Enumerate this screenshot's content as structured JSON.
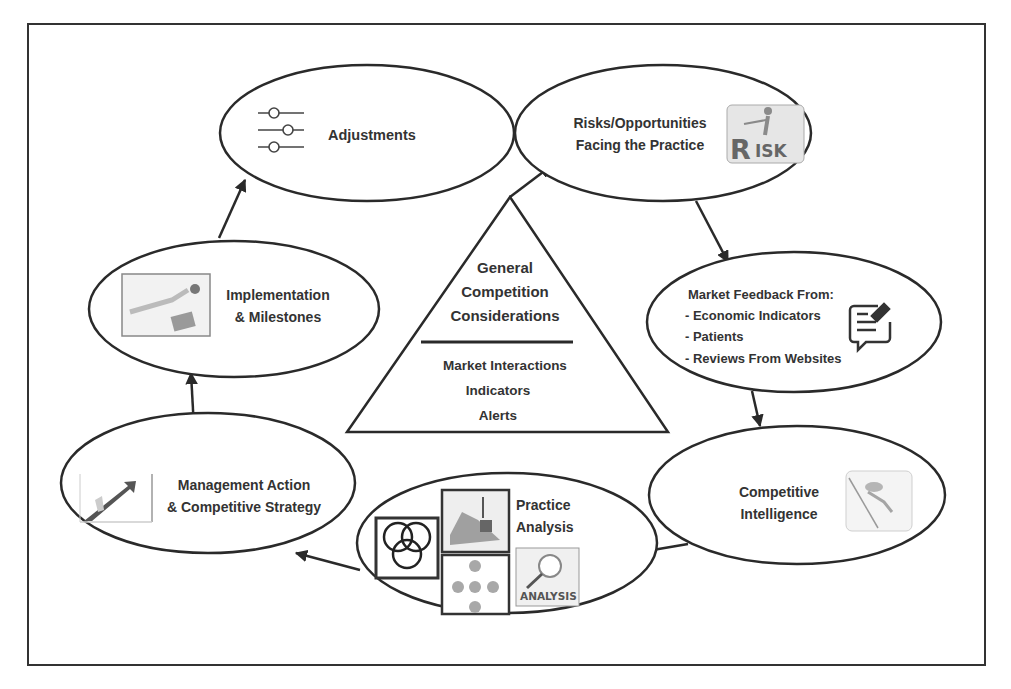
{
  "diagram": {
    "type": "cycle",
    "colors": {
      "stroke": "#2a2a2a",
      "text": "#333333",
      "background": "#ffffff",
      "icon_gray": "#8a8a8a"
    },
    "center": {
      "title_lines": [
        "General",
        "Competition",
        "Considerations"
      ],
      "items": [
        "Market Interactions",
        "Indicators",
        "Alerts"
      ]
    },
    "nodes": [
      {
        "id": "adjustments",
        "lines": [
          "Adjustments"
        ],
        "icon": "sliders-icon"
      },
      {
        "id": "risks",
        "lines": [
          "Risks/Opportunities",
          "Facing the Practice"
        ],
        "icon": "risk-icon",
        "icon_text": "RISK"
      },
      {
        "id": "market-feedback",
        "lines": [
          "Market Feedback From:",
          "- Economic Indicators",
          "- Patients",
          "- Reviews From Websites"
        ],
        "icon": "feedback-chat-icon"
      },
      {
        "id": "competitive-intelligence",
        "lines": [
          "Competitive",
          "Intelligence"
        ],
        "icon": "climber-icon"
      },
      {
        "id": "practice-analysis",
        "lines": [
          "Practice",
          "Analysis"
        ],
        "icons": [
          "venn-diagram-icon",
          "scale-chart-icon",
          "network-icon",
          "analysis-magnifier-icon"
        ],
        "icon_text": "ANALYSIS"
      },
      {
        "id": "management-action",
        "lines": [
          "Management Action",
          "& Competitive Strategy"
        ],
        "icon": "growth-arrow-icon"
      },
      {
        "id": "implementation",
        "lines": [
          "Implementation",
          "& Milestones"
        ],
        "icon": "milestone-icon"
      }
    ],
    "edges": [
      {
        "from": "triangle-apex",
        "to": "risks"
      },
      {
        "from": "risks",
        "to": "market-feedback"
      },
      {
        "from": "market-feedback",
        "to": "competitive-intelligence"
      },
      {
        "from": "competitive-intelligence",
        "to": "practice-analysis"
      },
      {
        "from": "practice-analysis",
        "to": "management-action"
      },
      {
        "from": "management-action",
        "to": "implementation"
      },
      {
        "from": "implementation",
        "to": "adjustments"
      }
    ]
  }
}
